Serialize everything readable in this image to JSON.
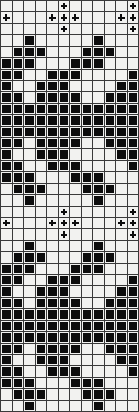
{
  "chart_data": {
    "type": "heatmap",
    "title": "",
    "xlabel": "",
    "ylabel": "",
    "columns": 12,
    "rows": 36,
    "legend": [
      {
        "symbol": "empty",
        "label": "blank stitch",
        "color": "#f2f2f0"
      },
      {
        "symbol": "filled",
        "label": "filled stitch",
        "color": "#0d0d0d"
      },
      {
        "symbol": "plus",
        "label": "plus stitch",
        "color": "#0d0d0d"
      }
    ],
    "grid_color": "#3a3a3a",
    "repeat_rows": 18,
    "cell_codes": {
      "0": "empty",
      "1": "filled",
      "2": "plus"
    },
    "grid": [
      [
        0,
        0,
        0,
        0,
        0,
        2,
        0,
        0,
        0,
        0,
        0,
        2
      ],
      [
        2,
        0,
        0,
        0,
        2,
        2,
        2,
        0,
        0,
        0,
        2,
        2
      ],
      [
        0,
        0,
        0,
        0,
        0,
        2,
        0,
        0,
        0,
        0,
        0,
        2
      ],
      [
        0,
        0,
        1,
        0,
        0,
        0,
        0,
        0,
        1,
        0,
        0,
        0
      ],
      [
        0,
        1,
        1,
        1,
        0,
        0,
        0,
        1,
        1,
        1,
        0,
        0
      ],
      [
        1,
        1,
        1,
        0,
        0,
        0,
        1,
        1,
        1,
        0,
        0,
        0
      ],
      [
        1,
        1,
        0,
        0,
        1,
        1,
        1,
        0,
        0,
        0,
        0,
        1
      ],
      [
        1,
        0,
        0,
        1,
        1,
        1,
        0,
        0,
        0,
        0,
        1,
        1
      ],
      [
        1,
        1,
        0,
        1,
        1,
        1,
        1,
        0,
        0,
        1,
        1,
        1
      ],
      [
        1,
        1,
        1,
        1,
        1,
        1,
        1,
        1,
        1,
        1,
        1,
        1
      ],
      [
        1,
        1,
        1,
        1,
        1,
        1,
        1,
        1,
        1,
        1,
        1,
        1
      ],
      [
        1,
        1,
        1,
        1,
        1,
        1,
        1,
        1,
        1,
        1,
        1,
        1
      ],
      [
        1,
        1,
        0,
        1,
        1,
        1,
        1,
        0,
        0,
        1,
        1,
        1
      ],
      [
        1,
        0,
        0,
        1,
        1,
        1,
        0,
        0,
        0,
        0,
        1,
        1
      ],
      [
        1,
        1,
        0,
        0,
        1,
        1,
        1,
        0,
        0,
        0,
        0,
        1
      ],
      [
        1,
        1,
        1,
        0,
        0,
        0,
        1,
        1,
        1,
        0,
        0,
        0
      ],
      [
        0,
        1,
        1,
        1,
        0,
        0,
        0,
        1,
        1,
        1,
        0,
        0
      ],
      [
        0,
        0,
        1,
        0,
        0,
        0,
        0,
        0,
        1,
        0,
        0,
        0
      ],
      [
        0,
        0,
        0,
        0,
        0,
        2,
        0,
        0,
        0,
        0,
        0,
        2
      ],
      [
        2,
        0,
        0,
        0,
        2,
        2,
        2,
        0,
        0,
        0,
        2,
        2
      ],
      [
        0,
        0,
        0,
        0,
        0,
        2,
        0,
        0,
        0,
        0,
        0,
        2
      ],
      [
        0,
        0,
        1,
        0,
        0,
        0,
        0,
        0,
        1,
        0,
        0,
        0
      ],
      [
        0,
        1,
        1,
        1,
        0,
        0,
        0,
        1,
        1,
        1,
        0,
        0
      ],
      [
        1,
        1,
        1,
        0,
        0,
        0,
        1,
        1,
        1,
        0,
        0,
        0
      ],
      [
        1,
        1,
        0,
        0,
        1,
        1,
        1,
        0,
        0,
        0,
        0,
        1
      ],
      [
        1,
        0,
        0,
        1,
        1,
        1,
        0,
        0,
        0,
        0,
        1,
        1
      ],
      [
        1,
        1,
        0,
        1,
        1,
        1,
        1,
        0,
        0,
        1,
        1,
        1
      ],
      [
        1,
        1,
        1,
        1,
        1,
        1,
        1,
        1,
        1,
        1,
        1,
        1
      ],
      [
        1,
        1,
        1,
        1,
        1,
        1,
        1,
        1,
        1,
        1,
        1,
        1
      ],
      [
        1,
        1,
        1,
        1,
        1,
        1,
        1,
        1,
        1,
        1,
        1,
        1
      ],
      [
        1,
        1,
        0,
        1,
        1,
        1,
        1,
        0,
        0,
        1,
        1,
        1
      ],
      [
        1,
        0,
        0,
        1,
        1,
        1,
        0,
        0,
        0,
        0,
        1,
        1
      ],
      [
        1,
        1,
        0,
        0,
        1,
        1,
        1,
        0,
        0,
        0,
        0,
        1
      ],
      [
        1,
        1,
        1,
        0,
        0,
        0,
        1,
        1,
        1,
        0,
        0,
        0
      ],
      [
        0,
        1,
        1,
        1,
        0,
        0,
        0,
        1,
        1,
        1,
        0,
        0
      ],
      [
        0,
        0,
        1,
        0,
        0,
        0,
        0,
        0,
        1,
        0,
        0,
        0
      ]
    ]
  }
}
